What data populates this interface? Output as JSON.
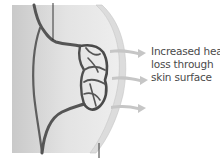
{
  "diagram": {
    "label": {
      "lines": [
        "Increased heat",
        "loss through",
        "skin surface"
      ]
    },
    "arrows": [
      {
        "name": "heat-arrow-upper",
        "y": 52
      },
      {
        "name": "heat-arrow-middle",
        "y": 79
      },
      {
        "name": "heat-arrow-lower",
        "y": 108
      }
    ],
    "colors": {
      "tissue": "#d9d9d9",
      "tissue_light": "#ececec",
      "skin_edge": "#cfcfcf",
      "vessel": "#5a5a5a",
      "vessel_dark": "#3a3a3a",
      "arrow": "#c8c8c8",
      "text": "#4a4a4a",
      "leader_line": "#222222"
    }
  }
}
